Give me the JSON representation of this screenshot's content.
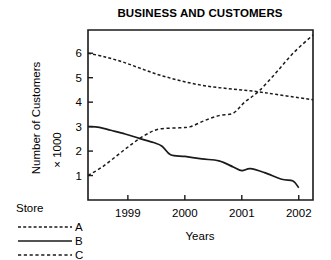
{
  "chart_data": {
    "type": "line",
    "title": "BUSINESS AND CUSTOMERS",
    "xlabel": "Years",
    "ylabel": "Number of Customers × 1000",
    "ylabel_line1": "Number of Customers",
    "ylabel_line2": "× 1000",
    "grid": false,
    "legend_position": "lower-left-outside",
    "legend_title": "Store",
    "xlim": [
      1998.3,
      2002.25
    ],
    "ylim": [
      0.0,
      6.95
    ],
    "xticks": [
      1999,
      2000,
      2001,
      2002
    ],
    "xtick_labels": [
      "1999",
      "2000",
      "2001",
      "2002"
    ],
    "yticks": [
      1,
      2,
      3,
      4,
      5,
      6
    ],
    "ytick_labels": [
      "1",
      "2",
      "3",
      "4",
      "5",
      "6"
    ],
    "series": [
      {
        "name": "A",
        "style": "dashed",
        "dash_pattern": "3,2.2",
        "stroke_width": 1.5,
        "color": "#1a1a1a",
        "x": [
          1998.3,
          1998.6,
          1998.9,
          1999.2,
          1999.5,
          1999.8,
          2000.1,
          2000.4,
          2000.7,
          2001.0,
          2001.3,
          2001.6,
          2002.0,
          2002.25
        ],
        "y": [
          6.0,
          5.85,
          5.65,
          5.4,
          5.15,
          4.95,
          4.78,
          4.65,
          4.57,
          4.5,
          4.42,
          4.32,
          4.18,
          4.1
        ]
      },
      {
        "name": "B",
        "style": "solid",
        "dash_pattern": "",
        "stroke_width": 1.7,
        "color": "#1a1a1a",
        "x": [
          1998.3,
          1998.5,
          1998.7,
          1998.95,
          1999.2,
          1999.45,
          1999.6,
          1999.75,
          2000.0,
          2000.3,
          2000.6,
          2000.85,
          2001.0,
          2001.15,
          2001.4,
          2001.7,
          2001.9,
          2002.0
        ],
        "y": [
          3.0,
          2.97,
          2.85,
          2.7,
          2.52,
          2.35,
          2.2,
          1.85,
          1.78,
          1.68,
          1.6,
          1.35,
          1.2,
          1.28,
          1.12,
          0.85,
          0.78,
          0.5
        ]
      },
      {
        "name": "C",
        "style": "dashed",
        "dash_pattern": "3.2,2.6",
        "stroke_width": 1.5,
        "color": "#1a1a1a",
        "x": [
          1998.3,
          1998.55,
          1998.8,
          1999.05,
          1999.3,
          1999.55,
          1999.9,
          2000.1,
          2000.35,
          2000.6,
          2000.85,
          2001.05,
          2001.3,
          2001.6,
          2001.9,
          2002.25
        ],
        "y": [
          1.0,
          1.35,
          1.8,
          2.25,
          2.65,
          2.9,
          2.95,
          3.0,
          3.25,
          3.45,
          3.55,
          4.0,
          4.45,
          5.2,
          6.0,
          6.75
        ]
      }
    ],
    "legend_entries": [
      {
        "label": "A",
        "style": "dashed",
        "dash_pattern": "3,2.2"
      },
      {
        "label": "B",
        "style": "solid",
        "dash_pattern": ""
      },
      {
        "label": "C",
        "style": "dashed",
        "dash_pattern": "3.2,2.6"
      }
    ]
  }
}
